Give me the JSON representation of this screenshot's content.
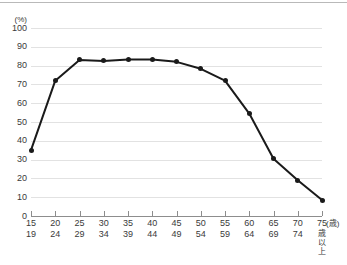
{
  "chart_data": {
    "type": "line",
    "title": "",
    "xlabel": "(歳)",
    "ylabel": "(%)",
    "unit_y": "(%)",
    "unit_x": "(歳)",
    "ylim": [
      0,
      100
    ],
    "ytick_step": 10,
    "grid": true,
    "legend": "none",
    "categories": [
      "15\n19",
      "20\n24",
      "25\n29",
      "30\n34",
      "35\n39",
      "40\n44",
      "45\n49",
      "50\n54",
      "55\n59",
      "60\n64",
      "65\n69",
      "70\n74",
      "75歳以上"
    ],
    "category_parts": [
      {
        "lo": "15",
        "hi": "19",
        "vertical": ""
      },
      {
        "lo": "20",
        "hi": "24",
        "vertical": ""
      },
      {
        "lo": "25",
        "hi": "29",
        "vertical": ""
      },
      {
        "lo": "30",
        "hi": "34",
        "vertical": ""
      },
      {
        "lo": "35",
        "hi": "39",
        "vertical": ""
      },
      {
        "lo": "40",
        "hi": "44",
        "vertical": ""
      },
      {
        "lo": "45",
        "hi": "49",
        "vertical": ""
      },
      {
        "lo": "50",
        "hi": "54",
        "vertical": ""
      },
      {
        "lo": "55",
        "hi": "59",
        "vertical": ""
      },
      {
        "lo": "60",
        "hi": "64",
        "vertical": ""
      },
      {
        "lo": "65",
        "hi": "69",
        "vertical": ""
      },
      {
        "lo": "70",
        "hi": "74",
        "vertical": ""
      },
      {
        "lo": "75",
        "hi": "",
        "vertical": "歳以上"
      }
    ],
    "values": [
      35,
      72,
      83,
      82.5,
      83.3,
      83.3,
      82,
      78.3,
      72,
      54.5,
      30.5,
      19,
      8.5
    ],
    "ytick_labels": [
      "100",
      "90",
      "80",
      "70",
      "60",
      "50",
      "40",
      "30",
      "20",
      "10",
      "0"
    ],
    "series_color": "#1a1a1a",
    "grid_color": "#e2e2e2",
    "axis_color": "#8d8d8d"
  }
}
